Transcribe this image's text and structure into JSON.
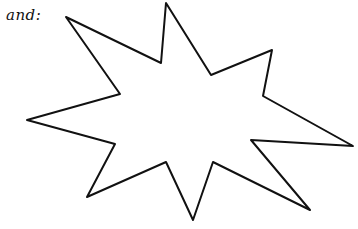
{
  "caption": {
    "text": "and:"
  },
  "drawing": {
    "shape": "star-burst-outline",
    "points": 8,
    "stroke_color": "#111111",
    "fill_color": "#ffffff",
    "vertices": [
      [
        66,
        17
      ],
      [
        120,
        94
      ],
      [
        27,
        120
      ],
      [
        115,
        144
      ],
      [
        87,
        197
      ],
      [
        166,
        162
      ],
      [
        193,
        220
      ],
      [
        213,
        162
      ],
      [
        310,
        210
      ],
      [
        251,
        140
      ],
      [
        353,
        146
      ],
      [
        263,
        96
      ],
      [
        272,
        50
      ],
      [
        211,
        75
      ],
      [
        166,
        3
      ],
      [
        161,
        63
      ]
    ]
  }
}
